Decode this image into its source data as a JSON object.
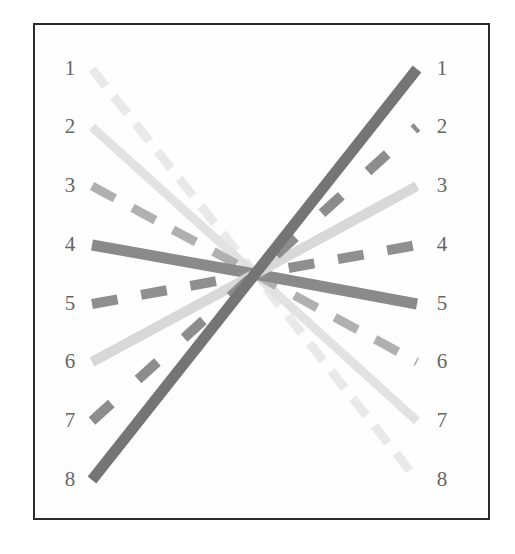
{
  "figure": {
    "type": "slope-permutation-diagram",
    "background_color": "#ffffff",
    "frame_border_color": "#2b2b2b",
    "label_color": "#666666",
    "convergence_point": {
      "x": 220,
      "y": 249
    }
  },
  "axis_left": {
    "name": "left-rank-axis",
    "labels": [
      "1",
      "2",
      "3",
      "4",
      "5",
      "6",
      "7",
      "8"
    ],
    "y_positions": [
      44,
      102,
      161,
      220,
      279,
      337,
      396,
      455
    ]
  },
  "axis_right": {
    "name": "right-rank-axis",
    "labels": [
      "1",
      "2",
      "3",
      "4",
      "5",
      "6",
      "7",
      "8"
    ],
    "y_positions": [
      44,
      102,
      161,
      220,
      279,
      337,
      396,
      455
    ]
  },
  "chart_data": {
    "type": "line",
    "title": "",
    "xlabel": "",
    "ylabel": "",
    "categories": [
      "1",
      "2",
      "3",
      "4",
      "5",
      "6",
      "7",
      "8"
    ],
    "note": "Eight connectors run from a left rank position through a common centre to a right rank position; each connector has its own grey tone, stroke width and dash pattern.",
    "series": [
      {
        "name": "connector-1",
        "left_rank": 1,
        "right_rank": 8,
        "color": "#e9e9e9",
        "width": 9,
        "dash": "22 13",
        "left_x": 57,
        "left_y": 44,
        "right_x": 382,
        "right_y": 455
      },
      {
        "name": "connector-2",
        "left_rank": 2,
        "right_rank": 7,
        "color": "#e2e2e2",
        "width": 9,
        "dash": "none",
        "left_x": 57,
        "left_y": 102,
        "right_x": 382,
        "right_y": 396
      },
      {
        "name": "connector-3",
        "left_rank": 3,
        "right_rank": 6,
        "color": "#b0b0b0",
        "width": 9,
        "dash": "26 20",
        "left_x": 57,
        "left_y": 161,
        "right_x": 382,
        "right_y": 337
      },
      {
        "name": "connector-4",
        "left_rank": 4,
        "right_rank": 5,
        "color": "#8a8a8a",
        "width": 11,
        "dash": "none",
        "left_x": 57,
        "left_y": 220,
        "right_x": 382,
        "right_y": 279
      },
      {
        "name": "connector-5",
        "left_rank": 5,
        "right_rank": 4,
        "color": "#8f8f8f",
        "width": 10,
        "dash": "26 24",
        "left_x": 57,
        "left_y": 279,
        "right_x": 382,
        "right_y": 220
      },
      {
        "name": "connector-6",
        "left_rank": 6,
        "right_rank": 3,
        "color": "#d8d8d8",
        "width": 10,
        "dash": "none",
        "left_x": 57,
        "left_y": 337,
        "right_x": 382,
        "right_y": 161
      },
      {
        "name": "connector-7",
        "left_rank": 7,
        "right_rank": 2,
        "color": "#8d8d8d",
        "width": 10,
        "dash": "26 36",
        "left_x": 57,
        "left_y": 396,
        "right_x": 382,
        "right_y": 102
      },
      {
        "name": "connector-8",
        "left_rank": 8,
        "right_rank": 1,
        "color": "#757575",
        "width": 11,
        "dash": "none",
        "left_x": 57,
        "left_y": 455,
        "right_x": 382,
        "right_y": 44
      }
    ]
  }
}
